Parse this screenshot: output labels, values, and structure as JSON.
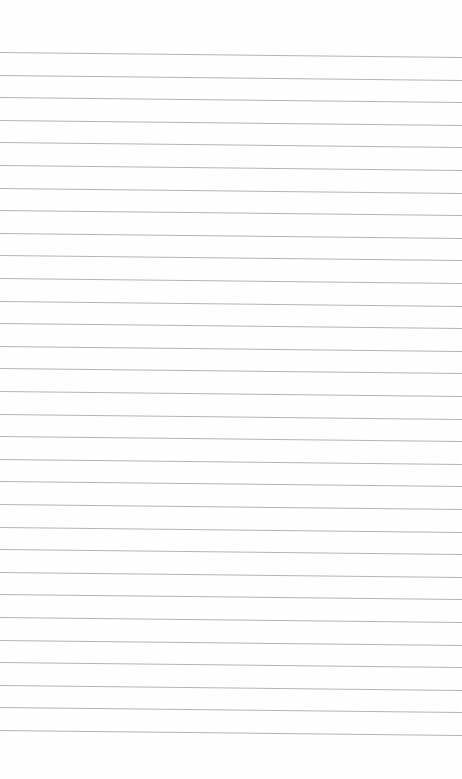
{
  "page": {
    "type": "lined-paper",
    "background_color": "#fefefe",
    "line_color": "#b4b4b4",
    "line_count": 31,
    "first_line_y": 52,
    "line_spacing": 22.6,
    "text": ""
  }
}
